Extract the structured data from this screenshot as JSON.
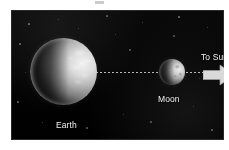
{
  "diagram": {
    "type": "astronomy-diagram",
    "panel": {
      "background_color": "#050505",
      "x": 11,
      "y": 10,
      "width": 213,
      "height": 130
    },
    "bodies": [
      {
        "id": "earth",
        "label": "Earth",
        "shape": "sphere",
        "cx": 52,
        "cy": 62,
        "radius": 33,
        "illuminated_side": "right",
        "phase": "half-lit",
        "surface_color": "#b4b4b4",
        "shadow_color": "#0a0a0a"
      },
      {
        "id": "moon",
        "label": "Moon",
        "shape": "sphere",
        "cx": 150,
        "cy": 62,
        "radius": 13,
        "illuminated_side": "right",
        "phase": "half-lit",
        "surface_color": "#cfcfcf",
        "shadow_color": "#0c0c0c"
      }
    ],
    "connectors": [
      {
        "id": "line-earth-moon",
        "style": "dotted",
        "from": "earth",
        "to": "moon",
        "color": "#d8d8d8"
      },
      {
        "id": "line-moon-sun",
        "style": "dotted",
        "from": "moon",
        "to": "sun-arrow",
        "color": "#d8d8d8"
      }
    ],
    "arrow": {
      "id": "sun-arrow",
      "label": "To Sun",
      "direction": "right",
      "fill_color": "#d9d9d9",
      "stroke_color": "#9a9a9a"
    },
    "labels": {
      "earth": "Earth",
      "moon": "Moon",
      "to_sun": "To Sun"
    },
    "label_color": "#f2f2f2",
    "page_background": "#ffffff"
  },
  "stars": [
    {
      "x": 18,
      "y": 14,
      "r": 0.6,
      "o": 0.45
    },
    {
      "x": 47,
      "y": 9,
      "r": 0.5,
      "o": 0.35
    },
    {
      "x": 96,
      "y": 6,
      "r": 0.6,
      "o": 0.4
    },
    {
      "x": 131,
      "y": 12,
      "r": 0.5,
      "o": 0.35
    },
    {
      "x": 168,
      "y": 7,
      "r": 0.7,
      "o": 0.5
    },
    {
      "x": 196,
      "y": 17,
      "r": 0.5,
      "o": 0.38
    },
    {
      "x": 9,
      "y": 34,
      "r": 0.6,
      "o": 0.42
    },
    {
      "x": 14,
      "y": 62,
      "r": 0.5,
      "o": 0.3
    },
    {
      "x": 7,
      "y": 92,
      "r": 0.6,
      "o": 0.4
    },
    {
      "x": 31,
      "y": 112,
      "r": 0.5,
      "o": 0.33
    },
    {
      "x": 76,
      "y": 118,
      "r": 0.6,
      "o": 0.38
    },
    {
      "x": 112,
      "y": 104,
      "r": 0.5,
      "o": 0.3
    },
    {
      "x": 119,
      "y": 40,
      "r": 0.6,
      "o": 0.36
    },
    {
      "x": 104,
      "y": 24,
      "r": 0.5,
      "o": 0.3
    },
    {
      "x": 140,
      "y": 112,
      "r": 0.6,
      "o": 0.35
    },
    {
      "x": 182,
      "y": 96,
      "r": 0.5,
      "o": 0.32
    },
    {
      "x": 201,
      "y": 120,
      "r": 0.6,
      "o": 0.38
    },
    {
      "x": 188,
      "y": 68,
      "r": 0.5,
      "o": 0.28
    },
    {
      "x": 163,
      "y": 26,
      "r": 0.6,
      "o": 0.34
    },
    {
      "x": 67,
      "y": 18,
      "r": 0.5,
      "o": 0.3
    }
  ]
}
